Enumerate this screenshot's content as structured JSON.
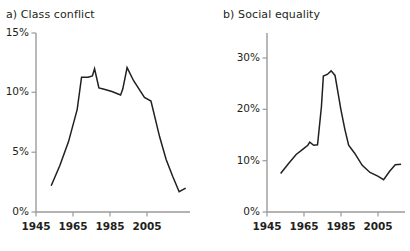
{
  "figure": {
    "background": "#ffffff",
    "line_color": "#231f20",
    "axis_color": "#9a9a9a",
    "text_color": "#231f20"
  },
  "panels": [
    {
      "key": "a",
      "title": "a) Class conflict",
      "ytick_labels": [
        "15%",
        "10%",
        "5%",
        "0%"
      ],
      "xtick_labels": [
        "1945",
        "1965",
        "1985",
        "2005"
      ]
    },
    {
      "key": "b",
      "title": "b) Social equality",
      "ytick_labels": [
        "30%",
        "20%",
        "10%",
        "0%"
      ],
      "xtick_labels": [
        "1945",
        "1965",
        "1985",
        "2005"
      ]
    }
  ],
  "chart_data": [
    {
      "type": "line",
      "panel": "a",
      "title": "a) Class conflict",
      "xlabel": "",
      "ylabel": "",
      "xlim": [
        1945,
        2016
      ],
      "ylim": [
        0,
        15
      ],
      "yticks": [
        0,
        5,
        10,
        15
      ],
      "ytick_labels": [
        "0%",
        "5%",
        "10%",
        "15%"
      ],
      "xticks": [
        1945,
        1965,
        1985,
        2005
      ],
      "xtick_labels": [
        "1945",
        "1965",
        "1985",
        "2005"
      ],
      "grid": false,
      "legend": null,
      "series": [
        {
          "name": "Class conflict",
          "color": "#231f20",
          "x": [
            1952,
            1956,
            1960,
            1964,
            1966,
            1969,
            1971,
            1972,
            1974,
            1976,
            1980,
            1984,
            1985,
            1987,
            1990,
            1995,
            1998,
            2002,
            2005,
            2008,
            2011,
            2014
          ],
          "y": [
            2.2,
            3.9,
            5.9,
            8.6,
            11.3,
            11.3,
            11.4,
            12.0,
            10.4,
            10.3,
            10.1,
            9.8,
            10.3,
            12.1,
            11.0,
            9.6,
            9.3,
            6.3,
            4.4,
            3.0,
            1.7,
            2.0
          ]
        }
      ]
    },
    {
      "type": "line",
      "panel": "b",
      "title": "b) Social equality",
      "xlabel": "",
      "ylabel": "",
      "xlim": [
        1945,
        2016
      ],
      "ylim": [
        0,
        33
      ],
      "yticks": [
        0,
        10,
        20,
        30
      ],
      "ytick_labels": [
        "0%",
        "10%",
        "20%",
        "30%"
      ],
      "xticks": [
        1945,
        1965,
        1985,
        2005
      ],
      "xtick_labels": [
        "1945",
        "1965",
        "1985",
        "2005"
      ],
      "grid": false,
      "legend": null,
      "series": [
        {
          "name": "Social equality",
          "color": "#231f20",
          "x": [
            1952,
            1956,
            1960,
            1964,
            1966,
            1967,
            1969,
            1971,
            1973,
            1974,
            1976,
            1978,
            1980,
            1983,
            1985,
            1987,
            1990,
            1994,
            1998,
            2002,
            2005,
            2008,
            2011,
            2014
          ],
          "y": [
            7.5,
            9.4,
            11.2,
            12.4,
            13.0,
            13.6,
            13.0,
            13.1,
            20.5,
            26.5,
            26.8,
            27.5,
            26.6,
            20.0,
            16.2,
            13.0,
            11.5,
            9.1,
            7.7,
            7.0,
            6.3,
            7.9,
            9.2,
            9.3
          ]
        }
      ]
    }
  ]
}
